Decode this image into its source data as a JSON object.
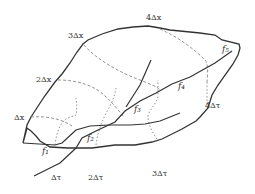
{
  "diagram": {
    "type": "fault-block-grid",
    "colors": {
      "outline": "#333333",
      "grid_lines": "#888888",
      "labels": "#333333",
      "background": "#ffffff"
    },
    "x_labels": [
      {
        "id": "dx1",
        "text": "Δx"
      },
      {
        "id": "dx2",
        "text": "2Δx"
      },
      {
        "id": "dx3",
        "text": "3Δx"
      },
      {
        "id": "dx4",
        "text": "4Δx"
      }
    ],
    "tau_labels": [
      {
        "id": "dt1",
        "text": "Δτ"
      },
      {
        "id": "dt2",
        "text": "2Δτ"
      },
      {
        "id": "dt3",
        "text": "3Δτ"
      },
      {
        "id": "dt4",
        "text": "4Δτ"
      }
    ],
    "faults": [
      {
        "id": "f1",
        "text": "f₁"
      },
      {
        "id": "f2",
        "text": "f₂"
      },
      {
        "id": "f3",
        "text": "f₃"
      },
      {
        "id": "f4",
        "text": "f₄"
      },
      {
        "id": "f5",
        "text": "f₅"
      }
    ]
  }
}
